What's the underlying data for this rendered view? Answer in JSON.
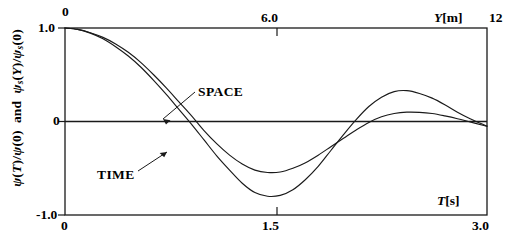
{
  "chart_data": {
    "type": "line",
    "title": "",
    "subtitle": "",
    "ylabel": "psi(T)/psi(0) and psi_s(Y)/psi_s(0)",
    "ylabel_parts": {
      "first_symbol": "ψ",
      "first": "(T)/",
      "first_symbol2": "ψ",
      "first_tail": "(0)",
      "conjunction": "and",
      "second_symbol": "ψ",
      "second_sub": "s",
      "second": "(Y)/",
      "second_symbol2": "ψ",
      "second_sub2": "s",
      "second_tail": "(0)"
    },
    "ylim": [
      -1.0,
      1.0
    ],
    "yticks": [
      1.0,
      0,
      -1.0
    ],
    "ytick_labels": [
      "1.0",
      "0",
      "-1.0"
    ],
    "grid": false,
    "legend_position": "inline-annotations",
    "axes": [
      {
        "id": "top",
        "name": "Y",
        "unit": "m",
        "label": "Y[m]",
        "lim": [
          0,
          12
        ],
        "ticks": [
          0,
          6.0,
          12
        ],
        "tick_labels": [
          "0",
          "6.0",
          "12"
        ],
        "position": "top"
      },
      {
        "id": "bottom",
        "name": "T",
        "unit": "s",
        "label": "T[s]",
        "lim": [
          0,
          3.0
        ],
        "ticks": [
          0,
          1.5,
          3.0
        ],
        "tick_labels": [
          "0",
          "1.5",
          "3.0"
        ],
        "position": "bottom"
      }
    ],
    "series": [
      {
        "name": "SPACE",
        "axis": "top",
        "xlabel_unit": "m",
        "color": "#1a1a1a",
        "annotation": "SPACE",
        "minimum": {
          "x": 5.2,
          "y": -0.54
        },
        "maximum": {
          "x": 9.3,
          "y": 0.1
        },
        "x": [
          0,
          0.36,
          0.72,
          1.08,
          1.44,
          1.8,
          2.16,
          2.52,
          2.88,
          3.24,
          3.6,
          3.96,
          4.32,
          4.68,
          5.04,
          5.4,
          5.76,
          6.12,
          6.48,
          6.84,
          7.2,
          7.56,
          7.92,
          8.28,
          8.64,
          9.0,
          9.36,
          9.72,
          10.08,
          10.44,
          10.8,
          11.16,
          11.52,
          11.88,
          12.0
        ],
        "values": [
          1.0,
          0.985,
          0.95,
          0.9,
          0.83,
          0.74,
          0.63,
          0.5,
          0.36,
          0.21,
          0.06,
          -0.1,
          -0.24,
          -0.36,
          -0.455,
          -0.52,
          -0.545,
          -0.54,
          -0.5,
          -0.44,
          -0.36,
          -0.27,
          -0.18,
          -0.09,
          -0.01,
          0.05,
          0.085,
          0.1,
          0.098,
          0.085,
          0.06,
          0.03,
          -0.005,
          -0.04,
          -0.05
        ]
      },
      {
        "name": "TIME",
        "axis": "bottom",
        "xlabel_unit": "s",
        "color": "#1a1a1a",
        "annotation": "TIME",
        "minimum": {
          "x": 1.36,
          "y": -0.8
        },
        "maximum": {
          "x": 2.4,
          "y": 0.33
        },
        "x": [
          0,
          0.09,
          0.18,
          0.27,
          0.36,
          0.45,
          0.54,
          0.63,
          0.72,
          0.81,
          0.9,
          0.99,
          1.08,
          1.17,
          1.26,
          1.35,
          1.44,
          1.53,
          1.62,
          1.71,
          1.8,
          1.89,
          1.98,
          2.07,
          2.16,
          2.25,
          2.34,
          2.43,
          2.52,
          2.61,
          2.7,
          2.79,
          2.88,
          2.97,
          3.0
        ],
        "values": [
          1.0,
          0.985,
          0.945,
          0.885,
          0.8,
          0.7,
          0.58,
          0.44,
          0.29,
          0.13,
          -0.03,
          -0.2,
          -0.37,
          -0.52,
          -0.66,
          -0.76,
          -0.8,
          -0.79,
          -0.73,
          -0.62,
          -0.48,
          -0.31,
          -0.14,
          0.02,
          0.16,
          0.26,
          0.32,
          0.33,
          0.3,
          0.25,
          0.18,
          0.1,
          0.03,
          -0.03,
          -0.05
        ]
      }
    ],
    "annotations": [
      {
        "text": "SPACE",
        "x_px": 200,
        "y_px": 95,
        "arrow_to_x_px": 163,
        "arrow_to_y_px": 121
      },
      {
        "text": "TIME",
        "x_px": 100,
        "y_px": 175,
        "arrow_to_x_px": 165,
        "arrow_to_y_px": 152
      }
    ],
    "colors": {
      "axis": "#1a1a1a",
      "curve": "#1a1a1a",
      "background": "#ffffff"
    }
  },
  "plot_box": {
    "left_px": 65,
    "right_px": 487,
    "top_px": 28,
    "bottom_px": 215,
    "zero_line_y_px": 121.5
  }
}
